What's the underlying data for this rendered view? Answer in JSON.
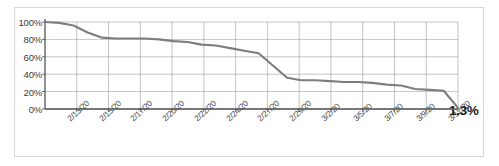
{
  "chart_data": {
    "type": "line",
    "title": "",
    "xlabel": "",
    "ylabel": "",
    "ylim": [
      0,
      100
    ],
    "ytick_labels": [
      "100%",
      "80%",
      "60%",
      "40%",
      "20%",
      "0%"
    ],
    "ytick_values": [
      100,
      80,
      60,
      40,
      20,
      0
    ],
    "grid": true,
    "legend": "none",
    "line_color": "#7d7d7d",
    "gridline_color": "#9a9a9a",
    "axis_color": "#555555",
    "xtick_labels": [
      "2/13/20",
      "2/15/20",
      "2/17/20",
      "2/20/20",
      "2/22/20",
      "2/24/20",
      "2/27/20",
      "2/29/20",
      "3/2/20",
      "3/5/20",
      "3/7/20",
      "3/9/20",
      "3/12/20"
    ],
    "x": [
      "2/12/20",
      "2/13/20",
      "2/14/20",
      "2/15/20",
      "2/16/20",
      "2/17/20",
      "2/18/20",
      "2/19/20",
      "2/20/20",
      "2/21/20",
      "2/22/20",
      "2/23/20",
      "2/24/20",
      "2/25/20",
      "2/26/20",
      "2/27/20",
      "2/28/20",
      "2/29/20",
      "3/1/20",
      "3/2/20",
      "3/3/20",
      "3/4/20",
      "3/5/20",
      "3/6/20",
      "3/7/20",
      "3/8/20",
      "3/9/20",
      "3/10/20",
      "3/11/20",
      "3/12/20"
    ],
    "values": [
      100,
      99,
      96,
      88,
      82,
      81,
      81,
      81,
      80,
      78,
      77,
      74,
      73,
      70,
      67,
      64,
      50,
      36,
      33,
      33,
      32,
      31,
      31,
      30,
      28,
      27,
      23,
      22,
      21,
      1.3
    ],
    "annotations": [
      {
        "name": "end-value",
        "text": "1.3%",
        "value": 1.3,
        "position": "end-right"
      }
    ]
  }
}
